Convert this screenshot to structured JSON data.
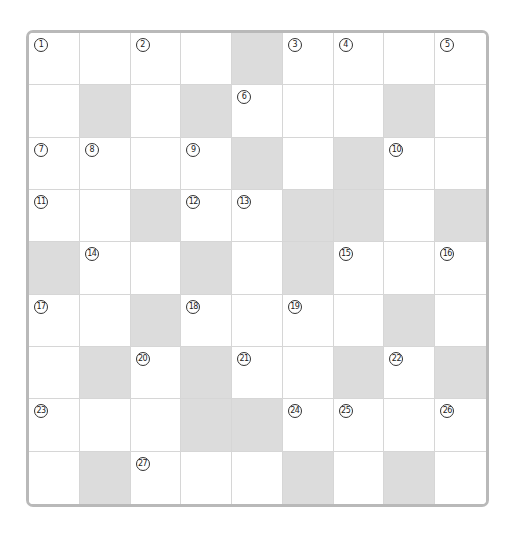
{
  "puzzle": {
    "rows": 9,
    "cols": 9,
    "colors": {
      "frame": "#b9b9b9",
      "block": "#dcdcdc",
      "cell": "#ffffff",
      "gridline": "#d6d6d6"
    },
    "blocks": [
      [
        0,
        4
      ],
      [
        1,
        1
      ],
      [
        1,
        3
      ],
      [
        1,
        7
      ],
      [
        2,
        4
      ],
      [
        2,
        6
      ],
      [
        3,
        2
      ],
      [
        3,
        5
      ],
      [
        3,
        6
      ],
      [
        3,
        8
      ],
      [
        4,
        0
      ],
      [
        4,
        3
      ],
      [
        4,
        5
      ],
      [
        5,
        2
      ],
      [
        5,
        7
      ],
      [
        6,
        1
      ],
      [
        6,
        3
      ],
      [
        6,
        6
      ],
      [
        6,
        8
      ],
      [
        7,
        3
      ],
      [
        7,
        4
      ],
      [
        8,
        1
      ],
      [
        8,
        5
      ],
      [
        8,
        7
      ]
    ],
    "numbers": [
      {
        "r": 0,
        "c": 0,
        "n": "1"
      },
      {
        "r": 0,
        "c": 2,
        "n": "2"
      },
      {
        "r": 0,
        "c": 5,
        "n": "3"
      },
      {
        "r": 0,
        "c": 6,
        "n": "4"
      },
      {
        "r": 0,
        "c": 8,
        "n": "5"
      },
      {
        "r": 1,
        "c": 4,
        "n": "6"
      },
      {
        "r": 2,
        "c": 0,
        "n": "7"
      },
      {
        "r": 2,
        "c": 1,
        "n": "8"
      },
      {
        "r": 2,
        "c": 3,
        "n": "9"
      },
      {
        "r": 2,
        "c": 7,
        "n": "10"
      },
      {
        "r": 3,
        "c": 0,
        "n": "11"
      },
      {
        "r": 3,
        "c": 3,
        "n": "12"
      },
      {
        "r": 3,
        "c": 4,
        "n": "13"
      },
      {
        "r": 4,
        "c": 1,
        "n": "14"
      },
      {
        "r": 4,
        "c": 6,
        "n": "15"
      },
      {
        "r": 4,
        "c": 8,
        "n": "16"
      },
      {
        "r": 5,
        "c": 0,
        "n": "17"
      },
      {
        "r": 5,
        "c": 3,
        "n": "18"
      },
      {
        "r": 5,
        "c": 5,
        "n": "19"
      },
      {
        "r": 6,
        "c": 2,
        "n": "20"
      },
      {
        "r": 6,
        "c": 4,
        "n": "21"
      },
      {
        "r": 6,
        "c": 7,
        "n": "22"
      },
      {
        "r": 7,
        "c": 0,
        "n": "23"
      },
      {
        "r": 7,
        "c": 5,
        "n": "24"
      },
      {
        "r": 7,
        "c": 6,
        "n": "25"
      },
      {
        "r": 7,
        "c": 8,
        "n": "26"
      },
      {
        "r": 8,
        "c": 2,
        "n": "27"
      }
    ]
  }
}
